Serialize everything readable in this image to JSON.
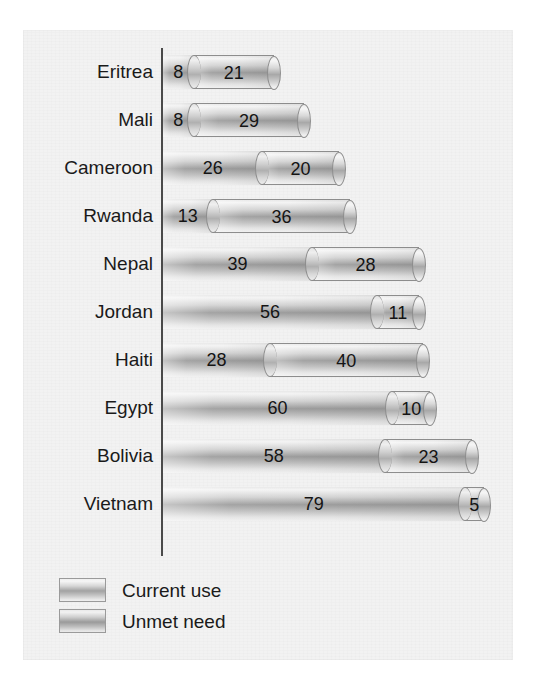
{
  "chart_data": {
    "type": "bar",
    "orientation": "horizontal",
    "stacked": true,
    "title": "",
    "xlabel": "",
    "ylabel": "",
    "xlim": [
      0,
      84
    ],
    "grid": false,
    "legend_position": "bottom-left",
    "categories": [
      "Eritrea",
      "Mali",
      "Cameroon",
      "Rwanda",
      "Nepal",
      "Jordan",
      "Haiti",
      "Egypt",
      "Bolivia",
      "Vietnam"
    ],
    "series": [
      {
        "name": "Current use",
        "values": [
          8,
          8,
          26,
          13,
          39,
          56,
          28,
          60,
          58,
          79
        ]
      },
      {
        "name": "Unmet need",
        "values": [
          21,
          29,
          20,
          36,
          28,
          11,
          40,
          10,
          23,
          5
        ]
      }
    ],
    "totals": [
      29,
      37,
      46,
      49,
      67,
      67,
      68,
      70,
      81,
      84
    ]
  },
  "legend": {
    "items": [
      {
        "label": "Current use"
      },
      {
        "label": "Unmet need"
      }
    ]
  },
  "style": {
    "panel_background": "#f2f2f2",
    "axis_color": "#4a4a4a",
    "bar_outline": "#8d8d8d",
    "text_color": "#1a1a1a"
  }
}
